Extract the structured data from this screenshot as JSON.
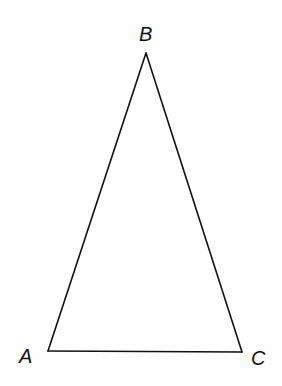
{
  "diagram": {
    "type": "triangle",
    "stroke_color": "#111111",
    "stroke_width": 1.6,
    "background": "#ffffff",
    "vertices": [
      {
        "name": "A",
        "x": 48,
        "y": 351
      },
      {
        "name": "B",
        "x": 146,
        "y": 53
      },
      {
        "name": "C",
        "x": 242,
        "y": 352
      }
    ],
    "sides": [
      {
        "name": "AB",
        "from": "A",
        "to": "B"
      },
      {
        "name": "BC",
        "from": "B",
        "to": "C"
      },
      {
        "name": "AC",
        "from": "A",
        "to": "C"
      }
    ],
    "labels": {
      "a": "A",
      "b": "B",
      "c": "C"
    }
  }
}
